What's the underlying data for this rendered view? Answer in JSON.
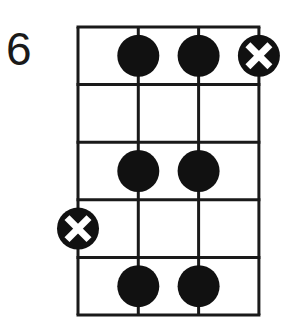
{
  "diagram": {
    "type": "bass-fretboard",
    "start_fret_label": "6",
    "strings": 4,
    "frets": 5,
    "grid": {
      "left": 78,
      "top": 27,
      "string_spacing": 60.3,
      "fret_spacing": 57.6
    },
    "colors": {
      "line": "#1a1a1a",
      "dot": "#111111",
      "cross": "#ffffff",
      "background": "#ffffff"
    },
    "markers": [
      {
        "string": 2,
        "fret": 1,
        "kind": "dot"
      },
      {
        "string": 3,
        "fret": 1,
        "kind": "dot"
      },
      {
        "string": 4,
        "fret": 1,
        "kind": "root-x"
      },
      {
        "string": 2,
        "fret": 3,
        "kind": "dot"
      },
      {
        "string": 3,
        "fret": 3,
        "kind": "dot"
      },
      {
        "string": 1,
        "fret": 4,
        "kind": "root-x"
      },
      {
        "string": 2,
        "fret": 5,
        "kind": "dot"
      },
      {
        "string": 3,
        "fret": 5,
        "kind": "dot"
      }
    ]
  }
}
